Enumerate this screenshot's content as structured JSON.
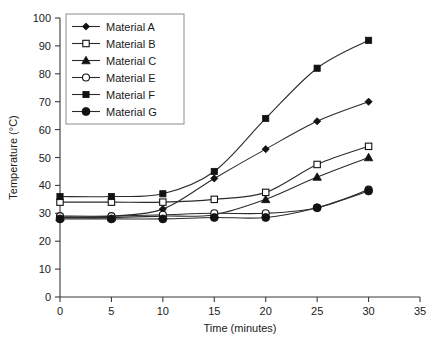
{
  "chart_data": {
    "type": "line",
    "title": "",
    "xlabel": "Time (minutes)",
    "ylabel": "Temperature (°C)",
    "xlim": [
      0,
      35
    ],
    "ylim": [
      0,
      100
    ],
    "xticks": [
      0,
      5,
      10,
      15,
      20,
      25,
      30,
      35
    ],
    "yticks": [
      0,
      10,
      20,
      30,
      40,
      50,
      60,
      70,
      80,
      90,
      100
    ],
    "grid": false,
    "legend_position": "upper-left",
    "x": [
      0,
      5,
      10,
      15,
      20,
      25,
      30
    ],
    "series": [
      {
        "name": "Material A",
        "marker": "diamond-filled",
        "values": [
          28.5,
          29,
          31.5,
          42.5,
          53,
          63,
          70
        ]
      },
      {
        "name": "Material B",
        "marker": "square-open",
        "values": [
          34,
          34,
          34,
          35,
          37.5,
          47.5,
          54
        ]
      },
      {
        "name": "Material C",
        "marker": "triangle-filled",
        "values": [
          28.5,
          28.5,
          29,
          29.5,
          35,
          43,
          50
        ]
      },
      {
        "name": "Material E",
        "marker": "circle-open",
        "values": [
          29,
          29,
          29.5,
          30,
          30,
          32,
          38.5
        ]
      },
      {
        "name": "Material F",
        "marker": "square-filled",
        "values": [
          36,
          36,
          37,
          45,
          64,
          82,
          92
        ]
      },
      {
        "name": "Material G",
        "marker": "circle-filled",
        "values": [
          28,
          28,
          28,
          28.5,
          28.5,
          32,
          38
        ]
      }
    ]
  },
  "axes": {
    "x_tick_labels": [
      "0",
      "5",
      "10",
      "15",
      "20",
      "25",
      "30",
      "35"
    ],
    "y_tick_labels": [
      "0",
      "10",
      "20",
      "30",
      "40",
      "50",
      "60",
      "70",
      "80",
      "90",
      "100"
    ],
    "x_title": "Time (minutes)",
    "y_title": "Temperature (°C)"
  },
  "legend": {
    "entries": [
      {
        "label": "Material A"
      },
      {
        "label": "Material B"
      },
      {
        "label": "Material C"
      },
      {
        "label": "Material E"
      },
      {
        "label": "Material F"
      },
      {
        "label": "Material G"
      }
    ]
  },
  "colors": {
    "line": "#2b2b2b",
    "axis": "#3a3a3a",
    "text": "#1a1a1a",
    "legend_border": "#8c8c8c",
    "background": "#ffffff"
  }
}
